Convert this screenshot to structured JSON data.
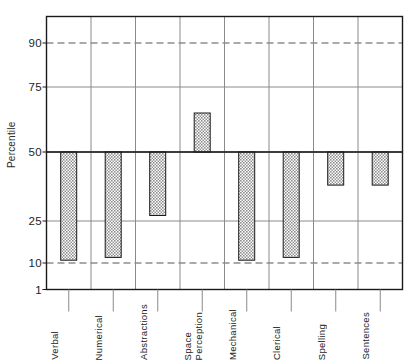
{
  "chart_data": {
    "type": "bar",
    "title": "",
    "xlabel": "",
    "ylabel": "Percentile",
    "categories": [
      "Verbal",
      "Numerical",
      "Abstractions",
      "Space Perception",
      "Mechanical",
      "Clerical",
      "Spelling",
      "Sentences"
    ],
    "category_lines": [
      [
        "Verbal"
      ],
      [
        "Numerical"
      ],
      [
        "Abstractions"
      ],
      [
        "Space",
        "Perception"
      ],
      [
        "Mechanical"
      ],
      [
        "Clerical"
      ],
      [
        "Spelling"
      ],
      [
        "Sentences"
      ]
    ],
    "values": [
      11,
      12,
      27,
      65,
      11,
      12,
      38,
      38
    ],
    "baseline": 50,
    "ylim": [
      1,
      99
    ],
    "ytick_values": [
      90,
      75,
      50,
      25,
      10,
      1
    ],
    "ytick_labels": [
      "90",
      "75",
      "50",
      "25",
      "10",
      "1"
    ],
    "dashed_gridlines": [
      90,
      10
    ],
    "solid_gridlines": [
      75,
      50,
      25
    ],
    "grid": true,
    "legend": "none",
    "bar_fill": "#9a9a9a",
    "bar_edge": "#1a1a1a",
    "axis_color": "#1a1a1a",
    "grid_color": "#8a8a8a"
  },
  "axes": {
    "y_title": "Percentile"
  },
  "icons": {
    "hatch_pattern": "crosshatch-fill-icon"
  }
}
